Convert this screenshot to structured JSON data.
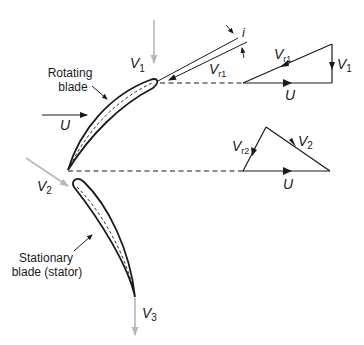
{
  "diagram": {
    "labels": {
      "rotating_blade_line1": "Rotating",
      "rotating_blade_line2": "blade",
      "stator_line1": "Stationary",
      "stator_line2": "blade (stator)",
      "blade_speed": "U",
      "v1_main": "V",
      "v1_sub": "1",
      "vr1_main": "V",
      "vr1_sub": "r1",
      "incidence": "i",
      "tri1_vr1_main": "V",
      "tri1_vr1_sub": "r1",
      "tri1_v1_main": "V",
      "tri1_v1_sub": "1",
      "tri1_u": "U",
      "tri2_vr2_main": "V",
      "tri2_vr2_sub": "r2",
      "tri2_v2_main": "V",
      "tri2_v2_sub": "2",
      "tri2_u": "U",
      "v2_main": "V",
      "v2_sub": "2",
      "v3_main": "V",
      "v3_sub": "3"
    },
    "colors": {
      "line": "#1a1a1a",
      "flow_arrow": "#b8b8b8"
    }
  }
}
